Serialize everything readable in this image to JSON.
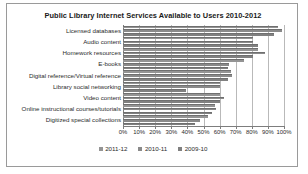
{
  "chart_data": {
    "type": "bar",
    "orientation": "horizontal",
    "title": "Public Library Internet Services Available to Users 2010-2012",
    "xlabel": "",
    "ylabel": "",
    "xlim": [
      0,
      100
    ],
    "grid": true,
    "legend_position": "bottom",
    "tick_labels": [
      "0%",
      "10%",
      "20%",
      "30%",
      "40%",
      "50%",
      "60%",
      "70%",
      "80%",
      "90%",
      "100%"
    ],
    "tick_values": [
      0,
      10,
      20,
      30,
      40,
      50,
      60,
      70,
      80,
      90,
      100
    ],
    "categories": [
      "Licensed databases",
      "Audio content",
      "Homework resources",
      "E-books",
      "Digital reference/Virtual reference",
      "Library social networking",
      "Video content",
      "Online instructional courses/tutorials",
      "Digitized special collections"
    ],
    "series": [
      {
        "name": "2011-12",
        "color": "#949494",
        "values": [
          96,
          81,
          84,
          75,
          67,
          60,
          60,
          57,
          53
        ]
      },
      {
        "name": "2010-11",
        "color": "#8a8a8a",
        "values": [
          99,
          81,
          88,
          66,
          68,
          60,
          63,
          58,
          48
        ]
      },
      {
        "name": "2009-10",
        "color": "#808080",
        "values": [
          94,
          84,
          81,
          65,
          65,
          39,
          60,
          55,
          45
        ]
      }
    ]
  },
  "legend": {
    "items": [
      {
        "label": "2011-12"
      },
      {
        "label": "2010-11"
      },
      {
        "label": "2009-10"
      }
    ]
  }
}
